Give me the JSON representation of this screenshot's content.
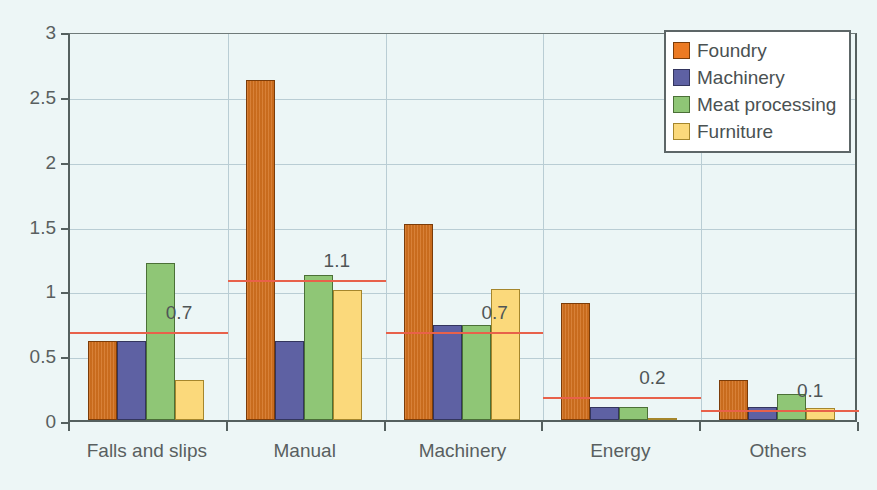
{
  "chart_data": {
    "type": "bar",
    "title": "",
    "subtitle": "",
    "xlabel": "",
    "ylabel": "",
    "ylim": [
      0,
      3
    ],
    "ytick_labels": [
      "0",
      "0.5",
      "1",
      "1.5",
      "2",
      "2.5",
      "3"
    ],
    "ytick_values": [
      0,
      0.5,
      1,
      1.5,
      2,
      2.5,
      3
    ],
    "grid": true,
    "legend_position": "top-right",
    "categories": [
      "Falls and slips",
      "Manual",
      "Machinery",
      "Energy",
      "Others"
    ],
    "series": [
      {
        "name": "Foundry",
        "color": "#d3711f",
        "values": [
          0.61,
          2.62,
          1.51,
          0.9,
          0.31
        ]
      },
      {
        "name": "Machinery",
        "color": "#5e61a3",
        "values": [
          0.61,
          0.61,
          0.73,
          0.1,
          0.1
        ]
      },
      {
        "name": "Meat processing",
        "color": "#8fc676",
        "values": [
          1.21,
          1.12,
          0.73,
          0.1,
          0.2
        ]
      },
      {
        "name": "Furniture",
        "color": "#fbd97b",
        "values": [
          0.31,
          1.0,
          1.01,
          0.01,
          0.09
        ]
      }
    ],
    "reference_lines": [
      {
        "category": "Falls and slips",
        "value": 0.7,
        "label": "0.7",
        "color": "#e8614a"
      },
      {
        "category": "Manual",
        "value": 1.1,
        "label": "1.1",
        "color": "#e8614a"
      },
      {
        "category": "Machinery",
        "value": 0.7,
        "label": "0.7",
        "color": "#e8614a"
      },
      {
        "category": "Energy",
        "value": 0.2,
        "label": "0.2",
        "color": "#e8614a"
      },
      {
        "category": "Others",
        "value": 0.1,
        "label": "0.1",
        "color": "#e8614a"
      }
    ]
  },
  "legend": {
    "items": [
      {
        "label": "Foundry"
      },
      {
        "label": "Machinery"
      },
      {
        "label": "Meat processing"
      },
      {
        "label": "Furniture"
      }
    ]
  },
  "axis": {
    "y_ticks": [
      {
        "label": "3"
      },
      {
        "label": "2.5"
      },
      {
        "label": "2"
      },
      {
        "label": "1.5"
      },
      {
        "label": "1"
      },
      {
        "label": "0.5"
      },
      {
        "label": "0"
      }
    ],
    "x_ticks": [
      {
        "label": "Falls and slips"
      },
      {
        "label": "Manual"
      },
      {
        "label": "Machinery"
      },
      {
        "label": "Energy"
      },
      {
        "label": "Others"
      }
    ]
  },
  "ref_labels": [
    {
      "text": "0.7"
    },
    {
      "text": "1.1"
    },
    {
      "text": "0.7"
    },
    {
      "text": "0.2"
    },
    {
      "text": "0.1"
    }
  ],
  "colors": {
    "background": "#edf6f6",
    "plot_background": "#ecf6f6",
    "grid": "#b9cdd4",
    "axis": "#55605f",
    "reference_line": "#e8614a",
    "text": "#595f60"
  }
}
